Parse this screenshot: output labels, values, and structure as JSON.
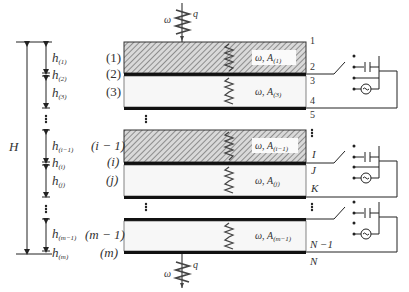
{
  "diagram": {
    "type": "multilayer-piezoelectric-stack-schematic",
    "top_load": {
      "omega": "ω",
      "q": "q"
    },
    "bottom_load": {
      "omega": "ω",
      "q": "q"
    },
    "total_height_label": "H",
    "thickness_labels": [
      {
        "h": "h",
        "sub": "(1)"
      },
      {
        "h": "h",
        "sub": "(2)"
      },
      {
        "h": "h",
        "sub": "(3)"
      },
      {
        "h": "h",
        "sub": "(i−1)"
      },
      {
        "h": "h",
        "sub": "(i)"
      },
      {
        "h": "h",
        "sub": "(j)"
      },
      {
        "h": "h",
        "sub": "(m−1)"
      },
      {
        "h": "h",
        "sub": "(m)"
      }
    ],
    "layer_labels": {
      "l1": "(1)",
      "l2": "(2)",
      "l3": "(3)",
      "li_1": "(i − 1)",
      "li": "(i)",
      "lj": "(j)",
      "lm_1": "(m − 1)",
      "lm": "(m)"
    },
    "layer_inner_labels": [
      {
        "text": "ω, A",
        "sub": "(1)"
      },
      {
        "text": "ω, A",
        "sub": "(3)"
      },
      {
        "text": "ω, A",
        "sub": "(i−1)"
      },
      {
        "text": "ω, A",
        "sub": "(j)"
      },
      {
        "text": "ω, A",
        "sub": "(m−1)"
      }
    ],
    "interface_labels": {
      "n1": "1",
      "n2": "2",
      "n3": "3",
      "n4": "4",
      "n5": "5",
      "nI": "I",
      "nJ": "J",
      "nK": "K",
      "nN1": "N −1",
      "nN": "N"
    },
    "circuit_components": [
      "switch",
      "open-contact",
      "capacitor",
      "short-circuit",
      "ac-source"
    ],
    "colors": {
      "line": "#222222",
      "hatch": "#8a8a8a",
      "fill": "#f7f7f7"
    }
  }
}
